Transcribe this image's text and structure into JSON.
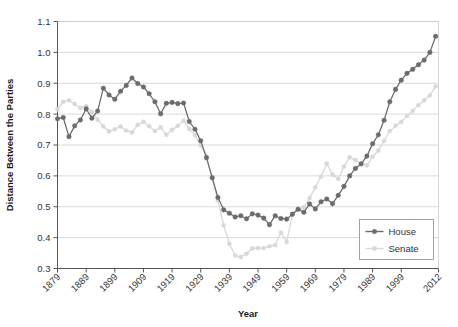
{
  "chart_data": {
    "type": "line",
    "title": "",
    "xlabel": "Year",
    "ylabel": "Distance Between the Parties",
    "xlim": [
      1879,
      2012
    ],
    "ylim": [
      0.3,
      1.1
    ],
    "grid": true,
    "legend_position": "bottom-right",
    "y_ticks": [
      "0.3",
      "0.4",
      "0.5",
      "0.6",
      "0.7",
      "0.8",
      "0.9",
      "1.0",
      "1.1"
    ],
    "y_tick_values": [
      0.3,
      0.4,
      0.5,
      0.6,
      0.7,
      0.8,
      0.9,
      1.0,
      1.1
    ],
    "x_ticks": [
      "1879",
      "1889",
      "1899",
      "1909",
      "1919",
      "1929",
      "1939",
      "1949",
      "1959",
      "1969",
      "1979",
      "1989",
      "1999",
      "2012"
    ],
    "x_tick_values": [
      1879,
      1889,
      1899,
      1909,
      1919,
      1929,
      1939,
      1949,
      1959,
      1969,
      1979,
      1989,
      1999,
      2012
    ],
    "colors": {
      "house": "#6b6b6b",
      "senate": "#d8d8d8",
      "grid": "#c9c9c9",
      "axis": "#555555",
      "text": "#333333",
      "background": "#ffffff"
    },
    "series": [
      {
        "name": "House",
        "color": "#6b6b6b",
        "marker": "circle",
        "x": [
          1879,
          1881,
          1883,
          1885,
          1887,
          1889,
          1891,
          1893,
          1895,
          1897,
          1899,
          1901,
          1903,
          1905,
          1907,
          1909,
          1911,
          1913,
          1915,
          1917,
          1919,
          1921,
          1923,
          1925,
          1927,
          1929,
          1931,
          1933,
          1935,
          1937,
          1939,
          1941,
          1943,
          1945,
          1947,
          1949,
          1951,
          1953,
          1955,
          1957,
          1959,
          1961,
          1963,
          1965,
          1967,
          1969,
          1971,
          1973,
          1975,
          1977,
          1979,
          1981,
          1983,
          1985,
          1987,
          1989,
          1991,
          1993,
          1995,
          1997,
          1999,
          2001,
          2003,
          2005,
          2007,
          2009,
          2011
        ],
        "values": [
          0.785,
          0.789,
          0.727,
          0.762,
          0.781,
          0.817,
          0.787,
          0.81,
          0.884,
          0.862,
          0.848,
          0.874,
          0.893,
          0.917,
          0.899,
          0.888,
          0.866,
          0.84,
          0.801,
          0.835,
          0.838,
          0.834,
          0.836,
          0.776,
          0.751,
          0.714,
          0.659,
          0.594,
          0.53,
          0.49,
          0.479,
          0.467,
          0.471,
          0.461,
          0.477,
          0.473,
          0.463,
          0.442,
          0.471,
          0.462,
          0.46,
          0.476,
          0.492,
          0.482,
          0.509,
          0.493,
          0.516,
          0.525,
          0.51,
          0.537,
          0.566,
          0.6,
          0.624,
          0.639,
          0.664,
          0.704,
          0.733,
          0.78,
          0.84,
          0.88,
          0.91,
          0.932,
          0.945,
          0.96,
          0.975,
          1.0,
          1.052
        ]
      },
      {
        "name": "Senate",
        "color": "#d8d8d8",
        "marker": "circle",
        "x": [
          1879,
          1881,
          1883,
          1885,
          1887,
          1889,
          1891,
          1893,
          1895,
          1897,
          1899,
          1901,
          1903,
          1905,
          1907,
          1909,
          1911,
          1913,
          1915,
          1917,
          1919,
          1921,
          1923,
          1925,
          1927,
          1929,
          1931,
          1933,
          1935,
          1937,
          1939,
          1941,
          1943,
          1945,
          1947,
          1949,
          1951,
          1953,
          1955,
          1957,
          1959,
          1961,
          1963,
          1965,
          1967,
          1969,
          1971,
          1973,
          1975,
          1977,
          1979,
          1981,
          1983,
          1985,
          1987,
          1989,
          1991,
          1993,
          1995,
          1997,
          1999,
          2001,
          2003,
          2005,
          2007,
          2009,
          2011
        ],
        "values": [
          0.816,
          0.84,
          0.845,
          0.833,
          0.82,
          0.826,
          0.807,
          0.782,
          0.76,
          0.744,
          0.751,
          0.76,
          0.747,
          0.741,
          0.765,
          0.775,
          0.761,
          0.745,
          0.757,
          0.733,
          0.749,
          0.762,
          0.779,
          0.752,
          0.732,
          0.699,
          0.663,
          0.595,
          0.52,
          0.44,
          0.38,
          0.342,
          0.337,
          0.348,
          0.365,
          0.366,
          0.366,
          0.372,
          0.376,
          0.416,
          0.386,
          0.474,
          0.492,
          0.498,
          0.528,
          0.563,
          0.598,
          0.64,
          0.604,
          0.59,
          0.63,
          0.66,
          0.651,
          0.64,
          0.634,
          0.662,
          0.682,
          0.713,
          0.745,
          0.762,
          0.775,
          0.794,
          0.81,
          0.829,
          0.845,
          0.861,
          0.89
        ]
      }
    ]
  },
  "legend": {
    "entries": [
      {
        "label": "House"
      },
      {
        "label": "Senate"
      }
    ]
  },
  "axes": {
    "x_title": "Year",
    "y_title": "Distance Between the Parties"
  }
}
